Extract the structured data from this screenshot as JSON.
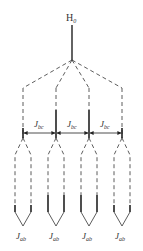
{
  "diagram": {
    "top_label": "H",
    "top_label_sub": "0",
    "coupling_label": "J",
    "coupling_label_sub": "bc",
    "leaf_label": "J",
    "leaf_label_sub": "ab",
    "columns": [
      {
        "index": 0,
        "x": 23,
        "heavy": false
      },
      {
        "index": 1,
        "x": 56,
        "heavy": true
      },
      {
        "index": 2,
        "x": 89,
        "heavy": true
      },
      {
        "index": 3,
        "x": 122,
        "heavy": false
      }
    ],
    "colors": {
      "line": "#222222",
      "text": "#333333"
    }
  }
}
